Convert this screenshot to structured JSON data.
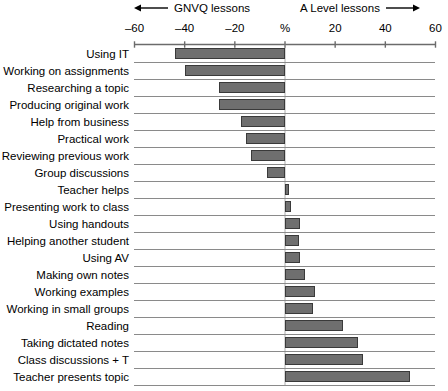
{
  "header": {
    "left_arrow_icon": "arrow-left-icon",
    "left_label": "GNVQ lessons",
    "right_label": "A Level lessons",
    "right_arrow_icon": "arrow-right-icon"
  },
  "colors": {
    "bar_fill": "#6f6f6f",
    "bar_stroke": "#3a3a3a",
    "axis": "#6b6b6b",
    "gridline": "#8a8a8a",
    "text": "#000000",
    "background": "#ffffff"
  },
  "chart_data": {
    "type": "bar",
    "orientation": "horizontal",
    "title": "",
    "subtitle": "",
    "xlabel": "%",
    "ylabel": "",
    "xlim": [
      -60,
      60
    ],
    "xticks": [
      -60,
      -40,
      -20,
      0,
      20,
      40,
      60
    ],
    "xticklabels": [
      "–60",
      "–40",
      "–20",
      "%",
      "20",
      "40",
      "60"
    ],
    "grid": true,
    "legend": null,
    "annotations": [
      {
        "text": "GNVQ lessons",
        "side": "left",
        "arrow": "left"
      },
      {
        "text": "A Level lessons",
        "side": "right",
        "arrow": "right"
      }
    ],
    "categories": [
      "Using IT",
      "Working on assignments",
      "Researching a topic",
      "Producing original work",
      "Help from business",
      "Practical work",
      "Reviewing previous work",
      "Group discussions",
      "Teacher helps",
      "Presenting work to class",
      "Using handouts",
      "Helping another student",
      "Using AV",
      "Making own notes",
      "Working examples",
      "Working in small groups",
      "Reading",
      "Taking dictated notes",
      "Class discussions + T",
      "Teacher presents topic"
    ],
    "values": [
      -44,
      -40,
      -26.5,
      -26.5,
      -17.5,
      -15.5,
      -13.5,
      -7,
      1.5,
      2.5,
      6,
      5.5,
      6,
      8,
      12,
      11,
      23,
      29,
      31,
      50
    ]
  }
}
